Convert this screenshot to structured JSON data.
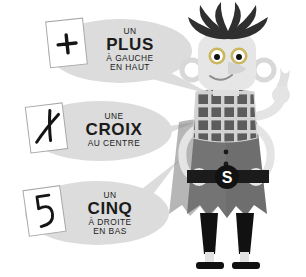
{
  "page": {
    "background_color": "#ffffff",
    "palette": {
      "bubble_fill": "#dcdcdc",
      "card_fill": "#ffffff",
      "card_stroke": "#9a9a9a",
      "ink": "#141414",
      "skin_light": "#e8e8e8",
      "skin_shadow": "#cfcfcf",
      "tunic_gray": "#6e6e6e",
      "tunic_dark": "#4a4a4a",
      "black": "#111111",
      "eye_iris": "#c9c9c9",
      "plaid_light": "#d2d2d2",
      "plaid_dark": "#5c5c5c"
    }
  },
  "bubbles": [
    {
      "id": "bubble-plus",
      "card_symbol": "+",
      "card_symbol_name": "plus-sign",
      "line1": "UN",
      "line2": "PLUS",
      "line3": "À GAUCHE",
      "line4": "EN HAUT"
    },
    {
      "id": "bubble-croix",
      "card_symbol": "✗",
      "card_symbol_name": "cross-sign",
      "line1": "UNE",
      "line2": "CROIX",
      "line3": "AU CENTRE",
      "line4": ""
    },
    {
      "id": "bubble-cinq",
      "card_symbol": "5",
      "card_symbol_name": "digit-five",
      "line1": "UN",
      "line2": "CINQ",
      "line3": "À DROITE",
      "line4": "EN BAS"
    }
  ],
  "character": {
    "name": "cartoon-character",
    "belt_buckle_letter": "S",
    "features": [
      "spiky-hair",
      "round-ears",
      "big-nose",
      "plaid-scarf",
      "belt-with-s-buckle",
      "pointing-finger"
    ]
  }
}
